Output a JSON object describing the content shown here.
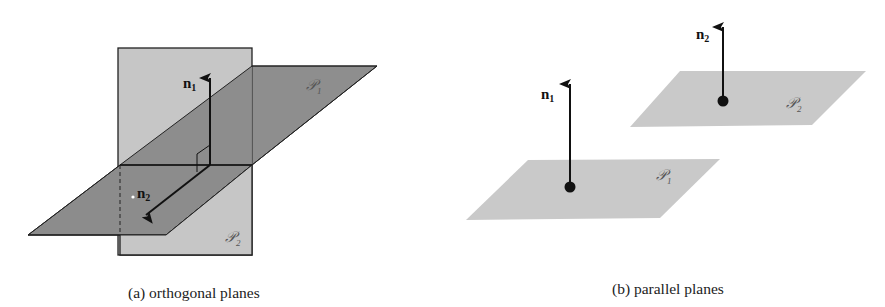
{
  "figure_a": {
    "caption": "(a)  orthogonal planes",
    "plane_1_label": "𝒫",
    "plane_1_sub": "1",
    "plane_2_label": "𝒫",
    "plane_2_sub": "2",
    "normal_1_label": "n",
    "normal_1_sub": "1",
    "normal_2_label": "n",
    "normal_2_sub": "2"
  },
  "figure_b": {
    "caption": "(b)  parallel planes",
    "plane_1_label": "𝒫",
    "plane_1_sub": "1",
    "plane_2_label": "𝒫",
    "plane_2_sub": "2",
    "normal_1_label": "n",
    "normal_1_sub": "1",
    "normal_2_label": "n",
    "normal_2_sub": "2"
  },
  "colors": {
    "vertical_plane": "#c6c6c6",
    "horizontal_plane_dark": "#8c8c8c",
    "parallel_plane": "#c9c9c9",
    "line": "#111111"
  }
}
